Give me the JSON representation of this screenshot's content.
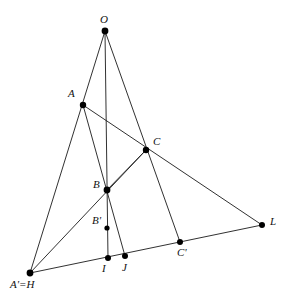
{
  "figure": {
    "background_color": "#ffffff",
    "line_color": "#1a1a1a",
    "point_color": "#000000",
    "line_width": 0.9,
    "point_radius": 3.0,
    "width": 286,
    "height": 302
  },
  "points": [
    {
      "id": "O",
      "label": "O",
      "x": 105,
      "y": 31,
      "label_x": 100,
      "label_y": 14,
      "r": 3.4
    },
    {
      "id": "A",
      "label": "A",
      "x": 83,
      "y": 105,
      "label_x": 68,
      "label_y": 88,
      "r": 3.2
    },
    {
      "id": "C",
      "label": "C",
      "x": 146,
      "y": 150,
      "label_x": 153,
      "label_y": 136,
      "r": 3.2
    },
    {
      "id": "B",
      "label": "B",
      "x": 107,
      "y": 190,
      "label_x": 93,
      "label_y": 179,
      "r": 3.4
    },
    {
      "id": "Bp",
      "label": "B'",
      "x": 107,
      "y": 228,
      "label_x": 92,
      "label_y": 215,
      "r": 2.6
    },
    {
      "id": "L",
      "label": "L",
      "x": 262,
      "y": 225,
      "label_x": 270,
      "label_y": 216,
      "r": 3.0
    },
    {
      "id": "Cp",
      "label": "C'",
      "x": 180,
      "y": 242,
      "label_x": 177,
      "label_y": 247,
      "r": 3.0
    },
    {
      "id": "I",
      "label": "I",
      "x": 108,
      "y": 258,
      "label_x": 102,
      "label_y": 263,
      "r": 3.0
    },
    {
      "id": "J",
      "label": "J",
      "x": 125,
      "y": 256,
      "label_x": 122,
      "label_y": 262,
      "r": 3.0
    },
    {
      "id": "ApH",
      "label": "A'=H",
      "x": 30,
      "y": 273,
      "label_x": 10,
      "label_y": 279,
      "r": 3.4
    }
  ],
  "segments": [
    {
      "name": "O-to-Aprime-H",
      "from": "O",
      "to": "ApH"
    },
    {
      "name": "O-to-I",
      "from": "O",
      "to": "I"
    },
    {
      "name": "O-to-Cprime",
      "from": "O",
      "to": "Cp"
    },
    {
      "name": "A-to-L",
      "from": "A",
      "to": "L"
    },
    {
      "name": "A-to-J",
      "from": "A",
      "to": "J"
    },
    {
      "name": "Aprime-H-to-C",
      "from": "ApH",
      "to": "C"
    },
    {
      "name": "Aprime-H-to-L",
      "from": "ApH",
      "to": "L"
    },
    {
      "name": "B-to-C",
      "from": "B",
      "to": "C"
    }
  ]
}
